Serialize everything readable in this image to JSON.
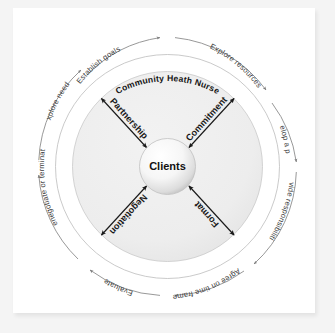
{
  "diagram": {
    "title": "Community Heath Nurse",
    "center": {
      "label": "Clients"
    },
    "outer_cycle": {
      "direction": "clockwise",
      "steps": [
        {
          "label": "Establish goals"
        },
        {
          "label": "Explore resources"
        },
        {
          "label": "Develop a plan"
        },
        {
          "label": "Divide responsibilities"
        },
        {
          "label": "Agree on time frame"
        },
        {
          "label": "Evaluate"
        },
        {
          "label": "Renegotiate or terminate"
        },
        {
          "label": "Explore needs"
        }
      ]
    },
    "spokes": [
      {
        "label": "Partnership",
        "position": "upper-left"
      },
      {
        "label": "Commitment",
        "position": "upper-right"
      },
      {
        "label": "Negotiation",
        "position": "lower-left"
      },
      {
        "label": "Format",
        "position": "lower-right"
      }
    ],
    "colors": {
      "page_background": "#f4f4f4",
      "card_background": "#ffffff",
      "inner_disc": "#ededed",
      "ring_band": "#ffffff",
      "arc_stroke": "#8c8c8c",
      "spoke_arrow": "#1a1a1a",
      "text": "#3c3c3c",
      "center_sphere": "#f7f7f7"
    }
  }
}
